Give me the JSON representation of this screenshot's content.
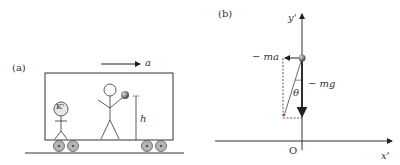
{
  "panel_a": {
    "label": "(a)",
    "accel_label": "a",
    "observer_label": "K'",
    "height_label": "h"
  },
  "panel_b": {
    "label": "(b)",
    "y_axis_label": "y'",
    "x_axis_label": "x'",
    "origin_label": "O",
    "force_ma_label": "− ma",
    "force_mg_label": "− mg",
    "angle_label": "θ"
  },
  "colors": {
    "line": "#333333",
    "ball": "#555555",
    "wheel": "#aaaaaa",
    "resultant_tip": "#c0392b"
  }
}
